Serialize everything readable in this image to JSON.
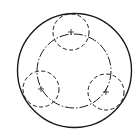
{
  "diagram": {
    "title": "",
    "stroke_color": "#1a1a1a",
    "background": "#ffffff",
    "outer_circle": {
      "cx": 74.5,
      "cy": 70.5,
      "r": 57,
      "style": "solid"
    },
    "pitch_circle": {
      "cx": 74,
      "cy": 71,
      "r": 37,
      "style": "dash-dot"
    },
    "small_circles": [
      {
        "label": "top",
        "cx": 71,
        "cy": 32,
        "r": 18,
        "style": "dashed"
      },
      {
        "label": "left",
        "cx": 41,
        "cy": 89,
        "r": 18,
        "style": "dashed"
      },
      {
        "label": "right",
        "cx": 106,
        "cy": 92,
        "r": 18,
        "style": "dashed"
      }
    ]
  }
}
